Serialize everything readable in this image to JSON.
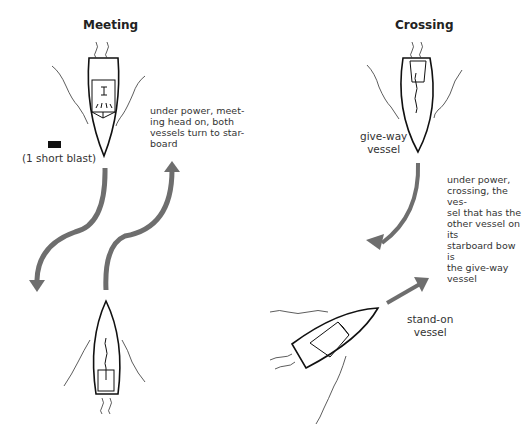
{
  "meeting": {
    "title": "Meeting",
    "caption_lines": [
      "under power, meet-",
      "ing head on, both",
      "vessels turn to star-",
      "board"
    ],
    "signal_label": "(1 short blast)"
  },
  "crossing": {
    "title": "Crossing",
    "give_way_label_lines": [
      "give-way",
      "vessel"
    ],
    "stand_on_label_lines": [
      "stand-on",
      "vessel"
    ],
    "caption_lines": [
      "under power,",
      "crossing, the ves-",
      "sel that has the",
      "other vessel on its",
      "starboard bow is",
      "the give-way",
      "vessel"
    ]
  },
  "colors": {
    "arrow": "#6e6e6e",
    "outline": "#111111"
  }
}
